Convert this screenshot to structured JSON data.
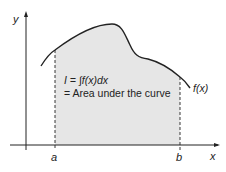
{
  "diagram": {
    "y_axis_label": "y",
    "x_axis_label": "x",
    "lower_limit_label": "a",
    "upper_limit_label": "b",
    "curve_label": "f(x)",
    "integral_line": "I = ∫f(x)dx",
    "area_line": "= Area under the curve",
    "colors": {
      "shade": "#e6e6e6",
      "line": "#222222"
    }
  }
}
